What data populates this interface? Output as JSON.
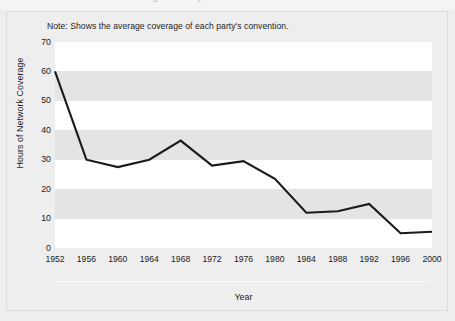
{
  "figure": {
    "ghost_title": "Network Coverage of Party Conventions",
    "note": "Note: Shows the average coverage of each party's convention.",
    "background_color": "#eeeeee",
    "plot_background_color": "#ffffff",
    "band_color": "#e4e4e4",
    "line_color": "#1a1a1a"
  },
  "chart_data": {
    "type": "line",
    "title": "",
    "xlabel": "Year",
    "ylabel": "Hours of Network Coverage",
    "x": [
      1952,
      1956,
      1960,
      1964,
      1968,
      1972,
      1976,
      1980,
      1984,
      1988,
      1992,
      1996,
      2000
    ],
    "categories": [
      "1952",
      "1956",
      "1960",
      "1964",
      "1968",
      "1972",
      "1976",
      "1980",
      "1984",
      "1988",
      "1992",
      "1996",
      "2000"
    ],
    "values": [
      60,
      30,
      27.5,
      30,
      36.5,
      28,
      29.5,
      23.5,
      12,
      12.5,
      15,
      5,
      5.5
    ],
    "series": [
      {
        "name": "Hours of Network Coverage",
        "values": [
          60,
          30,
          27.5,
          30,
          36.5,
          28,
          29.5,
          23.5,
          12,
          12.5,
          15,
          5,
          5.5
        ]
      }
    ],
    "xlim": [
      1952,
      2000
    ],
    "ylim": [
      0,
      70
    ],
    "yticks": [
      0,
      10,
      20,
      30,
      40,
      50,
      60,
      70
    ],
    "ytick_labels": [
      "0",
      "10",
      "20",
      "30",
      "40",
      "50",
      "60",
      "70"
    ],
    "xticks": [
      1952,
      1956,
      1960,
      1964,
      1968,
      1972,
      1976,
      1980,
      1984,
      1988,
      1992,
      1996,
      2000
    ],
    "xtick_labels": [
      "1952",
      "1956",
      "1960",
      "1964",
      "1968",
      "1972",
      "1976",
      "1980",
      "1984",
      "1988",
      "1992",
      "1996",
      "2000"
    ],
    "grid": false,
    "banded_background": true,
    "legend": null,
    "legend_position": "none",
    "annotations": [
      "Note: Shows the average coverage of each party's convention."
    ]
  }
}
